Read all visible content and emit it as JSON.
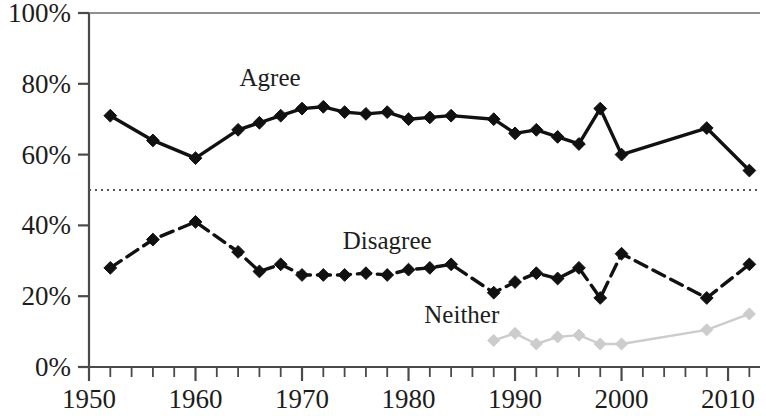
{
  "chart_data": {
    "type": "line",
    "title": "",
    "subtitle": "",
    "xlabel": "",
    "ylabel": "",
    "xlim": [
      1950,
      2013
    ],
    "ylim": [
      0,
      100
    ],
    "grid": false,
    "reference_lines": [
      {
        "name": "fifty-percent-line",
        "axis": "y",
        "value": 50,
        "style": "dotted",
        "color": "#555555"
      }
    ],
    "legend_position": "inline-annotations",
    "y_ticks": [
      0,
      20,
      40,
      60,
      80,
      100
    ],
    "y_tick_labels": [
      "0%",
      "20%",
      "40%",
      "60%",
      "80%",
      "100%"
    ],
    "x_ticks": [
      1950,
      1952,
      1954,
      1956,
      1958,
      1960,
      1962,
      1964,
      1966,
      1968,
      1970,
      1972,
      1974,
      1976,
      1978,
      1980,
      1982,
      1984,
      1986,
      1988,
      1990,
      1992,
      1994,
      1996,
      1998,
      2000,
      2002,
      2004,
      2006,
      2008,
      2010,
      2012
    ],
    "x_tick_labels": [
      "1950",
      "1960",
      "1970",
      "1980",
      "1990",
      "2000",
      "2010"
    ],
    "x_tick_label_values": [
      1950,
      1960,
      1970,
      1980,
      1990,
      2000,
      2010
    ],
    "series": [
      {
        "name": "Agree",
        "color": "#111111",
        "line_style": "solid",
        "marker": "diamond",
        "label_x": 1967,
        "label_y": 82,
        "x": [
          1952,
          1956,
          1960,
          1964,
          1966,
          1968,
          1970,
          1972,
          1974,
          1976,
          1978,
          1980,
          1982,
          1984,
          1988,
          1990,
          1992,
          1994,
          1996,
          1998,
          2000,
          2008,
          2012
        ],
        "values": [
          71,
          64,
          59,
          67,
          69,
          71,
          73,
          73.5,
          72,
          71.5,
          72,
          70,
          70.5,
          71,
          70,
          66,
          67,
          65,
          63,
          73,
          60,
          67.5,
          55.5
        ]
      },
      {
        "name": "Disagree",
        "color": "#111111",
        "line_style": "dashed",
        "marker": "diamond",
        "label_x": 1978,
        "label_y": 36,
        "x": [
          1952,
          1956,
          1960,
          1964,
          1966,
          1968,
          1970,
          1972,
          1974,
          1976,
          1978,
          1980,
          1982,
          1984,
          1988,
          1990,
          1992,
          1994,
          1996,
          1998,
          2000,
          2008,
          2012
        ],
        "values": [
          28,
          36,
          41,
          32.5,
          27,
          29,
          26,
          26,
          26,
          26.5,
          26,
          27.5,
          28,
          29,
          21,
          24,
          26.5,
          25,
          28,
          19.5,
          32,
          19.5,
          29
        ]
      },
      {
        "name": "Neither",
        "color": "#cccccc",
        "line_style": "solid",
        "marker": "diamond",
        "label_x": 1985,
        "label_y": 15,
        "x": [
          1988,
          1990,
          1992,
          1994,
          1996,
          1998,
          2000,
          2008,
          2012
        ],
        "values": [
          7.5,
          9.5,
          6.5,
          8.5,
          9,
          6.5,
          6.5,
          10.5,
          15
        ]
      }
    ]
  },
  "axes": {
    "y_axis_name": "percent-axis",
    "x_axis_name": "year-axis"
  }
}
